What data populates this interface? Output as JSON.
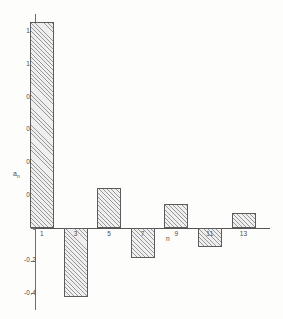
{
  "chart_data": {
    "type": "bar",
    "title": "",
    "subtitle": "",
    "xlabel": "n",
    "ylabel": "a",
    "ylabel_subscript": "n",
    "categories": [
      "1",
      "3",
      "5",
      "7",
      "9",
      "11",
      "13"
    ],
    "values": [
      1.26,
      -0.42,
      0.245,
      -0.185,
      0.145,
      -0.115,
      0.09
    ],
    "ylim": [
      -0.5,
      1.32
    ],
    "y_ticks": [
      1.2,
      1.0,
      0.8,
      0.6,
      0.4,
      0.2,
      0,
      -0.2,
      -0.4
    ],
    "y_tick_labels": [
      "1.2",
      "1.0",
      "0.8",
      "0.6",
      "0.4",
      "0.2",
      "0",
      "-0.2",
      "-0.4"
    ],
    "x_tick_labels": [
      "1",
      "3",
      "5",
      "7",
      "9",
      "11",
      "13"
    ],
    "grid": false,
    "legend": null,
    "legend_position": "none",
    "bar_fill": "diagonal-hatch",
    "bar_edge_color": "#5b5b5b",
    "axis_color": "#6e6e6e",
    "background_color": "#fdfdfb"
  },
  "figure": {
    "name": "fourier-coefficient-bar-chart"
  }
}
